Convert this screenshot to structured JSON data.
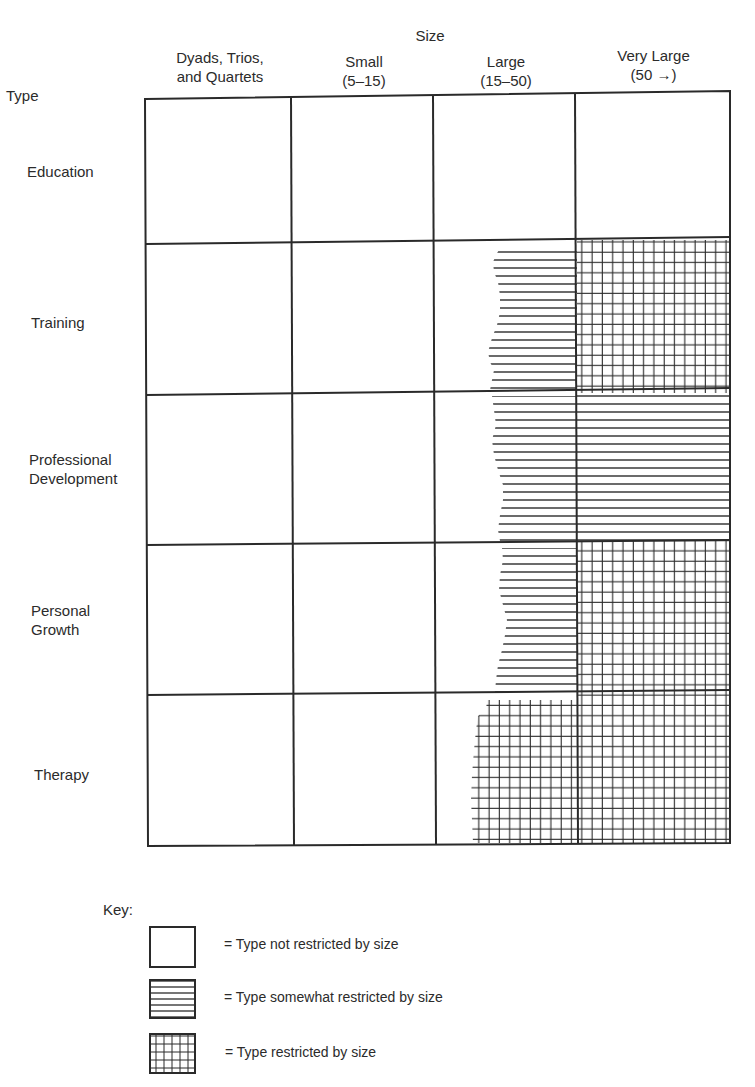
{
  "diagram": {
    "size_title": "Size",
    "type_title": "Type",
    "columns": [
      {
        "line1": "Dyads, Trios,",
        "line2": "and Quartets"
      },
      {
        "line1": "Small",
        "line2": "(5–15)"
      },
      {
        "line1": "Large",
        "line2": "(15–50)"
      },
      {
        "line1": "Very Large",
        "line2": "(50 →)"
      }
    ],
    "rows": [
      {
        "line1": "Education",
        "line2": "",
        "cells": [
          "none",
          "none",
          "none",
          "none"
        ]
      },
      {
        "line1": "Training",
        "line2": "",
        "cells": [
          "none",
          "none",
          "somewhat",
          "restricted"
        ]
      },
      {
        "line1": "Professional",
        "line2": "Development",
        "cells": [
          "none",
          "none",
          "somewhat",
          "somewhat"
        ]
      },
      {
        "line1": "Personal",
        "line2": "Growth",
        "cells": [
          "none",
          "none",
          "somewhat",
          "restricted"
        ]
      },
      {
        "line1": "Therapy",
        "line2": "",
        "cells": [
          "none",
          "none",
          "restricted",
          "restricted"
        ]
      }
    ]
  },
  "key": {
    "title": "Key:",
    "items": [
      {
        "pattern": "none",
        "label": "= Type not restricted by size"
      },
      {
        "pattern": "somewhat",
        "label": "= Type somewhat restricted by size"
      },
      {
        "pattern": "restricted",
        "label": "= Type restricted by size"
      }
    ]
  },
  "colors": {
    "ink": "#2a2a2a",
    "background": "#ffffff"
  }
}
